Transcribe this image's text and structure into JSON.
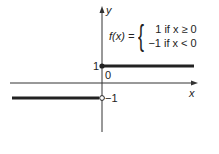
{
  "diagram": {
    "type": "piecewise-function-graph",
    "axes": {
      "x_label": "x",
      "y_label": "y",
      "origin_label": "0"
    },
    "ticks": {
      "y_one": "1",
      "y_minus_one": "−1"
    },
    "formula": {
      "lhs": "f(x) =",
      "cases": [
        {
          "value": "1",
          "condition": "if x ≥ 0",
          "text": "1 if x ≥ 0"
        },
        {
          "value": "−1",
          "condition": "if x < 0",
          "text": "−1 if x < 0"
        }
      ]
    },
    "colors": {
      "line": "#222222",
      "background": "#ffffff"
    }
  }
}
